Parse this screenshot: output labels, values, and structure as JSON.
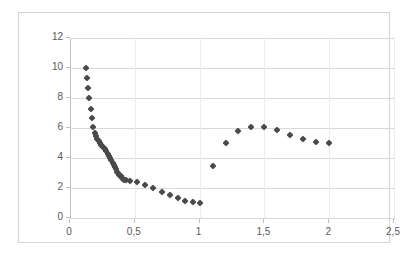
{
  "chart_data": {
    "type": "scatter",
    "title": "",
    "xlabel": "",
    "ylabel": "",
    "xlim": [
      0,
      2.5
    ],
    "ylim": [
      0,
      12
    ],
    "grid": true,
    "legend": false,
    "marker_color": "#4a4a4a",
    "marker_shape": "diamond",
    "decimal_separator": ",",
    "x_ticks": [
      {
        "value": 0,
        "label": "0"
      },
      {
        "value": 0.5,
        "label": "0,5"
      },
      {
        "value": 1,
        "label": "1"
      },
      {
        "value": 1.5,
        "label": "1,5"
      },
      {
        "value": 2,
        "label": "2"
      },
      {
        "value": 2.5,
        "label": "2,5"
      }
    ],
    "y_ticks": [
      {
        "value": 0,
        "label": "0"
      },
      {
        "value": 2,
        "label": "2"
      },
      {
        "value": 4,
        "label": "4"
      },
      {
        "value": 6,
        "label": "6"
      },
      {
        "value": 8,
        "label": "8"
      },
      {
        "value": 10,
        "label": "10"
      },
      {
        "value": 12,
        "label": "12"
      }
    ],
    "series": [
      {
        "name": "Series 1",
        "points": [
          [
            0.12,
            10.0
          ],
          [
            0.13,
            9.35
          ],
          [
            0.14,
            8.65
          ],
          [
            0.15,
            8.0
          ],
          [
            0.16,
            7.3
          ],
          [
            0.17,
            6.65
          ],
          [
            0.18,
            6.1
          ],
          [
            0.19,
            5.7
          ],
          [
            0.2,
            5.45
          ],
          [
            0.21,
            5.3
          ],
          [
            0.22,
            5.15
          ],
          [
            0.23,
            5.0
          ],
          [
            0.24,
            4.9
          ],
          [
            0.25,
            4.8
          ],
          [
            0.26,
            4.7
          ],
          [
            0.27,
            4.6
          ],
          [
            0.28,
            4.45
          ],
          [
            0.29,
            4.3
          ],
          [
            0.3,
            4.15
          ],
          [
            0.31,
            4.0
          ],
          [
            0.32,
            3.85
          ],
          [
            0.33,
            3.7
          ],
          [
            0.34,
            3.55
          ],
          [
            0.35,
            3.4
          ],
          [
            0.355,
            3.25
          ],
          [
            0.36,
            3.1
          ],
          [
            0.37,
            3.0
          ],
          [
            0.38,
            2.9
          ],
          [
            0.39,
            2.8
          ],
          [
            0.4,
            2.7
          ],
          [
            0.41,
            2.62
          ],
          [
            0.42,
            2.56
          ],
          [
            0.43,
            2.52
          ],
          [
            0.46,
            2.5
          ],
          [
            0.52,
            2.4
          ],
          [
            0.58,
            2.2
          ],
          [
            0.64,
            2.0
          ],
          [
            0.71,
            1.75
          ],
          [
            0.77,
            1.55
          ],
          [
            0.83,
            1.35
          ],
          [
            0.89,
            1.15
          ],
          [
            0.95,
            1.05
          ],
          [
            1.0,
            1.0
          ],
          [
            1.1,
            3.45
          ],
          [
            1.2,
            5.0
          ],
          [
            1.3,
            5.8
          ],
          [
            1.4,
            6.1
          ],
          [
            1.5,
            6.08
          ],
          [
            1.6,
            5.85
          ],
          [
            1.7,
            5.52
          ],
          [
            1.8,
            5.27
          ],
          [
            1.9,
            5.08
          ],
          [
            2.0,
            5.0
          ]
        ]
      }
    ]
  }
}
